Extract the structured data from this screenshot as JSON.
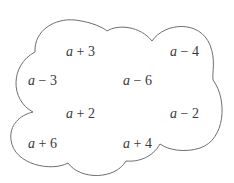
{
  "diagram": {
    "shape": "cloud",
    "outline_color": "#6e6e6e",
    "text_color": "#3a3a3a",
    "expressions": [
      {
        "var": "a",
        "op": "+",
        "num": "3",
        "text": "a + 3",
        "x": 66,
        "y": 45
      },
      {
        "var": "a",
        "op": "−",
        "num": "4",
        "text": "a − 4",
        "x": 170,
        "y": 45
      },
      {
        "var": "a",
        "op": "−",
        "num": "3",
        "text": "a − 3",
        "x": 28,
        "y": 74
      },
      {
        "var": "a",
        "op": "−",
        "num": "6",
        "text": "a − 6",
        "x": 123,
        "y": 74
      },
      {
        "var": "a",
        "op": "+",
        "num": "2",
        "text": "a + 2",
        "x": 66,
        "y": 107
      },
      {
        "var": "a",
        "op": "−",
        "num": "2",
        "text": "a − 2",
        "x": 170,
        "y": 107
      },
      {
        "var": "a",
        "op": "+",
        "num": "6",
        "text": "a + 6",
        "x": 28,
        "y": 137
      },
      {
        "var": "a",
        "op": "+",
        "num": "4",
        "text": "a + 4",
        "x": 123,
        "y": 137
      }
    ]
  }
}
